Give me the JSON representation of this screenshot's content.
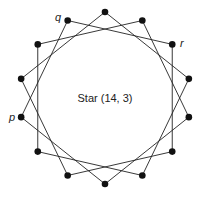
{
  "diagram": {
    "title": "Star (14, 3)",
    "n": 14,
    "step": 3,
    "center": [
      105,
      98
    ],
    "radius": 86,
    "labels": {
      "p": "p",
      "q": "q",
      "r": "r"
    },
    "colors": {
      "line": "#222222",
      "vertex": "#111111",
      "background": "#ffffff"
    }
  }
}
